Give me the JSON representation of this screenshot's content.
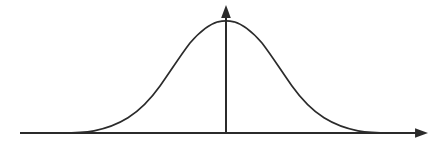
{
  "figure": {
    "title": "Normal distribution bell curve",
    "background_color": "#ffffff",
    "stroke_color": "#2b2b2b",
    "width": 446,
    "height": 147
  },
  "axes": {
    "x_axis": {
      "name": "horizontal-axis",
      "x_start": 20,
      "x_end": 428,
      "y": 133,
      "stroke_width": 2.0,
      "arrow": "right",
      "label": ""
    },
    "y_axis": {
      "name": "vertical-axis",
      "x": 226,
      "y_start": 133,
      "y_end": 5,
      "stroke_width": 2.0,
      "arrow": "up",
      "label": ""
    },
    "arrow_size": 7
  },
  "chart_data": {
    "type": "line",
    "title": "",
    "subtitle": "",
    "xlabel": "",
    "ylabel": "",
    "legend": [],
    "grid": false,
    "axis_arrows": true,
    "distribution": "gaussian",
    "mean_px": 226,
    "sigma_px": 55,
    "peak_y_px": 21,
    "baseline_y_px": 133,
    "xlim": [
      20,
      428
    ],
    "ylim": [
      133,
      5
    ],
    "tick_labels_x": [],
    "tick_labels_y": [],
    "annotations": [],
    "x": [
      20,
      34,
      48,
      62,
      76,
      92,
      106,
      120,
      134,
      148,
      162,
      176,
      190,
      204,
      218,
      226,
      234,
      248,
      262,
      276,
      290,
      304,
      318,
      332,
      346,
      360,
      374,
      388,
      402,
      416,
      428
    ],
    "y": [
      133.0,
      133.0,
      133.0,
      132.9,
      132.4,
      130.6,
      128.3,
      124.3,
      118.0,
      108.8,
      96.8,
      82.6,
      67.7,
      53.7,
      42.2,
      21.0,
      42.2,
      53.7,
      67.7,
      82.6,
      96.8,
      108.8,
      118.0,
      124.3,
      128.3,
      130.6,
      132.4,
      132.9,
      133.0,
      133.0,
      133.0
    ],
    "curve_path": "M 20 133.2 L 62 133.1 C 78 132.9 86 132.2 94 130.8 C 108 128.2 118 124.0 128 117.8 C 140 110.2 150 100.0 160 86.0 C 170 72.0 180 56.0 190 43.0 C 200 31.5 210 24.0 218 21.8 C 221 21.1 223.5 20.9 226 20.9 C 228.5 20.9 231 21.1 234 21.8 C 242 24.0 252 31.5 262 43.0 C 272 56.0 282 72.0 292 86.0 C 302 100.0 312 110.2 324 117.8 C 334 124.0 344 128.2 358 130.8 C 366 132.2 374 132.9 390 133.1 L 412 133.2"
  },
  "markers": {
    "left_tail_contact_x": 92,
    "right_tail_contact_x": 360,
    "peak_point": {
      "x": 226,
      "y": 21
    }
  }
}
